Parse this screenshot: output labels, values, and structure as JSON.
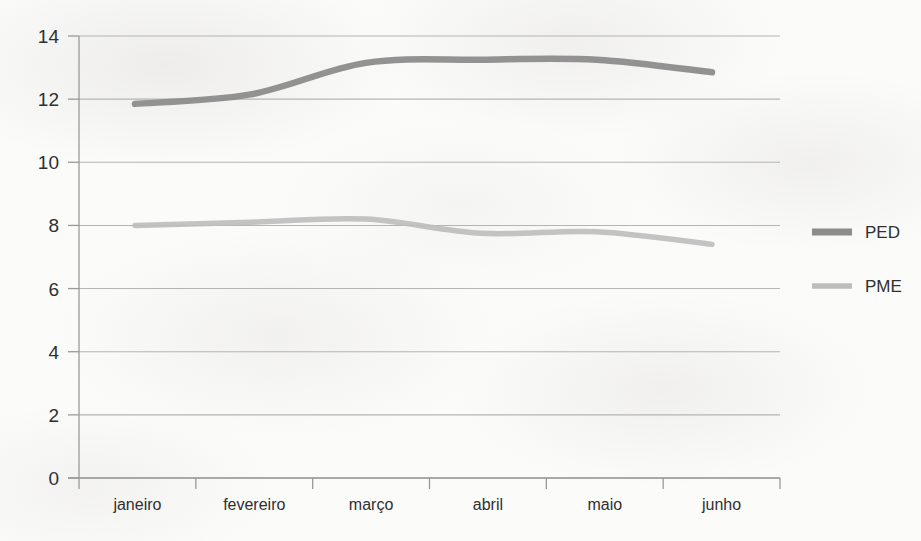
{
  "chart_data": {
    "type": "line",
    "title": "",
    "subtitle": "",
    "xlabel": "",
    "ylabel": "",
    "categories": [
      "janeiro",
      "fevereiro",
      "março",
      "abril",
      "maio",
      "junho"
    ],
    "series": [
      {
        "name": "PED",
        "color": "#8c8c8c",
        "values": [
          11.85,
          12.15,
          13.15,
          13.25,
          13.25,
          12.85
        ]
      },
      {
        "name": "PME",
        "color": "#bdbdbd",
        "values": [
          8.0,
          8.1,
          8.2,
          7.75,
          7.8,
          7.4
        ]
      }
    ],
    "ylim": [
      0,
      14
    ],
    "ytick_step": 2,
    "yticks": [
      "0",
      "2",
      "4",
      "6",
      "8",
      "10",
      "12",
      "14"
    ],
    "grid": true,
    "grid_axis": "y",
    "legend_position": "right",
    "axis_color": "#9a9a9a",
    "grid_color": "#a8a8a8",
    "text_color": "#2f2f2f",
    "background": "#fbfbfa"
  },
  "legend": {
    "entries": [
      {
        "label": "PED",
        "swatch_color": "#8c8c8c"
      },
      {
        "label": "PME",
        "swatch_color": "#bdbdbd"
      }
    ]
  }
}
